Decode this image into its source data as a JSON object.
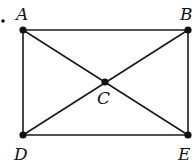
{
  "diagram": {
    "type": "geometry",
    "colors": {
      "line": "#1a1a1a",
      "point": "#111111",
      "background": "#ffffff"
    },
    "points": [
      {
        "id": "A",
        "label": "A",
        "x": 23,
        "y": 30,
        "lx": 16,
        "ly": 20
      },
      {
        "id": "B",
        "label": "B",
        "x": 188,
        "y": 30,
        "lx": 180,
        "ly": 20
      },
      {
        "id": "C",
        "label": "C",
        "x": 105,
        "y": 82,
        "lx": 97,
        "ly": 104
      },
      {
        "id": "D",
        "label": "D",
        "x": 23,
        "y": 135,
        "lx": 14,
        "ly": 160
      },
      {
        "id": "E",
        "label": "E",
        "x": 188,
        "y": 135,
        "lx": 178,
        "ly": 160
      }
    ],
    "segments": [
      [
        "A",
        "B"
      ],
      [
        "B",
        "E"
      ],
      [
        "E",
        "D"
      ],
      [
        "D",
        "A"
      ],
      [
        "A",
        "E"
      ],
      [
        "B",
        "D"
      ]
    ],
    "bullet": "."
  }
}
